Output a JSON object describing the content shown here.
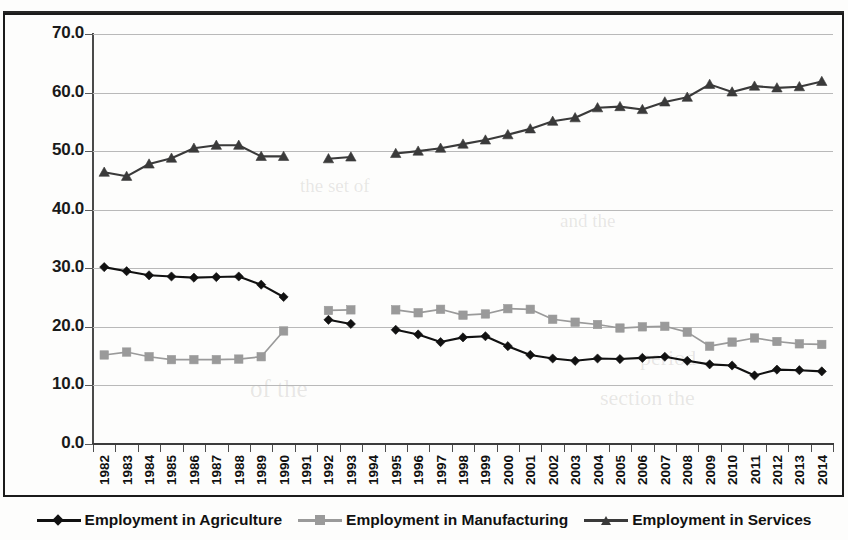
{
  "chart_data": {
    "type": "line",
    "title": "",
    "subtitle": "",
    "xlabel": "",
    "ylabel": "",
    "ylim": [
      0,
      70
    ],
    "ytick_values": [
      0,
      10,
      20,
      30,
      40,
      50,
      60,
      70
    ],
    "ytick_labels": [
      "0.0",
      "10.0",
      "20.0",
      "30.0",
      "40.0",
      "50.0",
      "60.0",
      "70.0"
    ],
    "grid": true,
    "legend_position": "bottom",
    "categories": [
      "1982",
      "1983",
      "1984",
      "1985",
      "1986",
      "1987",
      "1988",
      "1989",
      "1990",
      "1991",
      "1992",
      "1993",
      "1994",
      "1995",
      "1996",
      "1997",
      "1998",
      "1999",
      "2000",
      "2001",
      "2002",
      "2003",
      "2004",
      "2005",
      "2006",
      "2007",
      "2008",
      "2009",
      "2010",
      "2011",
      "2012",
      "2013",
      "2014"
    ],
    "series": [
      {
        "name": "Employment in Agriculture",
        "marker": "diamond",
        "color": "#111111",
        "values": [
          30.2,
          29.5,
          28.8,
          28.6,
          28.4,
          28.5,
          28.6,
          27.2,
          25.1,
          null,
          21.2,
          20.5,
          null,
          19.5,
          18.7,
          17.4,
          18.2,
          18.4,
          16.7,
          15.2,
          14.6,
          14.2,
          14.6,
          14.5,
          14.7,
          14.9,
          14.2,
          13.6,
          13.4,
          11.7,
          12.7,
          12.6,
          12.4
        ]
      },
      {
        "name": "Employment in Manufacturing",
        "marker": "square",
        "color": "#9a9a9a",
        "values": [
          15.2,
          15.7,
          14.9,
          14.4,
          14.4,
          14.4,
          14.5,
          14.9,
          19.3,
          null,
          22.8,
          22.9,
          null,
          22.9,
          22.4,
          23.0,
          22.0,
          22.2,
          23.1,
          23.0,
          21.3,
          20.8,
          20.4,
          19.8,
          20.0,
          20.1,
          19.1,
          16.7,
          17.4,
          18.1,
          17.5,
          17.1,
          17.0
        ]
      },
      {
        "name": "Employment in Services",
        "marker": "triangle",
        "color": "#3a3a3a",
        "values": [
          46.4,
          45.7,
          47.8,
          48.8,
          50.5,
          51.0,
          51.0,
          49.1,
          49.1,
          null,
          48.7,
          49.0,
          null,
          49.6,
          50.0,
          50.5,
          51.2,
          51.9,
          52.8,
          53.8,
          55.1,
          55.7,
          57.4,
          57.6,
          57.1,
          58.4,
          59.2,
          61.4,
          60.1,
          61.1,
          60.8,
          61.0,
          61.9
        ]
      }
    ]
  },
  "legend": {
    "items": [
      {
        "label": "Employment in Agriculture",
        "marker": "diamond",
        "color": "#111111"
      },
      {
        "label": "Employment in Manufacturing",
        "marker": "square",
        "color": "#9a9a9a"
      },
      {
        "label": "Employment in Services",
        "marker": "triangle",
        "color": "#3a3a3a"
      }
    ]
  }
}
